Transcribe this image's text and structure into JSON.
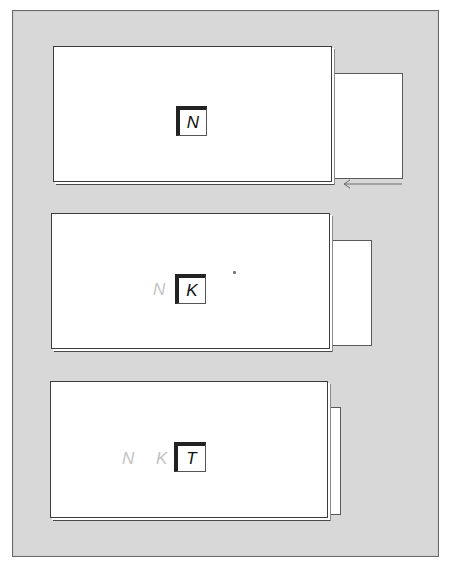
{
  "diagram": {
    "colors": {
      "panel_background": "#d8d8d8",
      "card_background": "#ffffff",
      "active_label": "#111111",
      "faded_label": "#c4c4c4",
      "box_border": "#222222"
    },
    "cards": [
      {
        "active_label": "N",
        "faded_labels": []
      },
      {
        "active_label": "K",
        "faded_labels": [
          "N"
        ]
      },
      {
        "active_label": "T",
        "faded_labels": [
          "N",
          "K"
        ]
      }
    ],
    "arrow": {
      "direction": "left",
      "description": "leftward arrow below first card's side panel"
    }
  }
}
